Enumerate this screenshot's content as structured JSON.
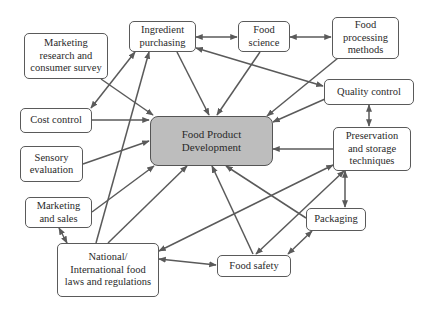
{
  "diagram": {
    "title": "Food Product Development",
    "colors": {
      "line": "#5a5a5a",
      "center_fill": "#bdbdbd",
      "node_fill": "#ffffff",
      "text": "#2a2a2a"
    },
    "nodes": {
      "center": {
        "label": "Food Product\nDevelopment"
      },
      "ingredient": {
        "label": "Ingredient\npurchasing"
      },
      "food_science": {
        "label": "Food\nscience"
      },
      "processing": {
        "label": "Food\nprocessing\nmethods"
      },
      "marketing_research": {
        "label": "Marketing\nresearch and\nconsumer survey"
      },
      "quality": {
        "label": "Quality control"
      },
      "cost": {
        "label": "Cost control"
      },
      "preservation": {
        "label": "Preservation\nand storage\ntechniques"
      },
      "sensory": {
        "label": "Sensory\nevaluation"
      },
      "marketing_sales": {
        "label": "Marketing\nand sales"
      },
      "packaging": {
        "label": "Packaging"
      },
      "laws": {
        "label": "National/\nInternational food\nlaws and regulations"
      },
      "food_safety": {
        "label": "Food safety"
      }
    },
    "edges": [
      {
        "from": "Ingredient purchasing",
        "to": "Food science",
        "type": "bidirectional"
      },
      {
        "from": "Food science",
        "to": "Food processing methods",
        "type": "bidirectional"
      },
      {
        "from": "Ingredient purchasing",
        "to": "Food Product Development",
        "type": "directed"
      },
      {
        "from": "Food science",
        "to": "Food Product Development",
        "type": "directed"
      },
      {
        "from": "Food processing methods",
        "to": "Food Product Development",
        "type": "directed"
      },
      {
        "from": "Quality control",
        "to": "Ingredient purchasing",
        "type": "directed"
      },
      {
        "from": "Quality control",
        "to": "Food Product Development",
        "type": "directed"
      },
      {
        "from": "Quality control",
        "to": "Preservation and storage techniques",
        "type": "bidirectional"
      },
      {
        "from": "Marketing research and consumer survey",
        "to": "Food Product Development",
        "type": "directed"
      },
      {
        "from": "Cost control",
        "to": "Ingredient purchasing",
        "type": "bidirectional"
      },
      {
        "from": "Cost control",
        "to": "Food Product Development",
        "type": "directed"
      },
      {
        "from": "Sensory evaluation",
        "to": "Food Product Development",
        "type": "directed"
      },
      {
        "from": "Marketing and sales",
        "to": "Food Product Development",
        "type": "directed"
      },
      {
        "from": "Marketing and sales",
        "to": "National/International food laws and regulations",
        "type": "bidirectional"
      },
      {
        "from": "National/International food laws and regulations",
        "to": "Ingredient purchasing",
        "type": "directed"
      },
      {
        "from": "National/International food laws and regulations",
        "to": "Food Product Development",
        "type": "directed"
      },
      {
        "from": "National/International food laws and regulations",
        "to": "Preservation and storage techniques",
        "type": "bidirectional"
      },
      {
        "from": "National/International food laws and regulations",
        "to": "Food safety",
        "type": "bidirectional"
      },
      {
        "from": "Preservation and storage techniques",
        "to": "Food Product Development",
        "type": "directed"
      },
      {
        "from": "Preservation and storage techniques",
        "to": "Packaging",
        "type": "bidirectional"
      },
      {
        "from": "Packaging",
        "to": "Food Product Development",
        "type": "directed"
      },
      {
        "from": "Food safety",
        "to": "Food Product Development",
        "type": "directed"
      },
      {
        "from": "Food safety",
        "to": "Preservation and storage techniques",
        "type": "bidirectional"
      },
      {
        "from": "Food safety",
        "to": "Packaging",
        "type": "bidirectional"
      }
    ]
  }
}
